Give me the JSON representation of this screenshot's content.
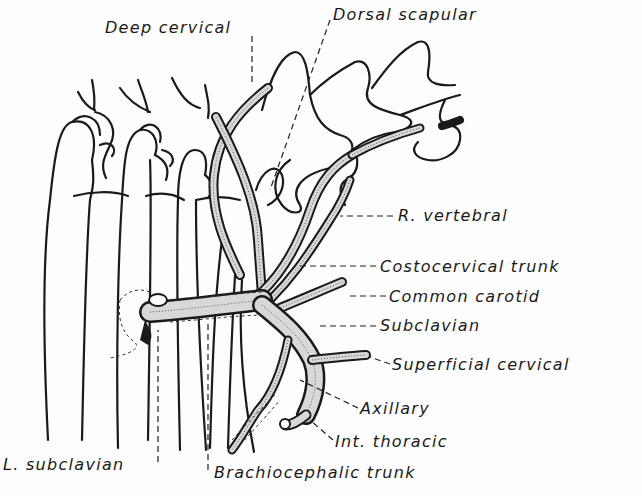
{
  "figure": {
    "labels": [
      {
        "id": "deep-cervical",
        "text": "Deep cervical",
        "x": 105,
        "y": 20
      },
      {
        "id": "dorsal-scapular",
        "text": "Dorsal scapular",
        "x": 333,
        "y": 7
      },
      {
        "id": "r-vertebral",
        "text": "R. vertebral",
        "x": 398,
        "y": 208
      },
      {
        "id": "costocervical-trunk",
        "text": "Costocervical trunk",
        "x": 380,
        "y": 259
      },
      {
        "id": "common-carotid",
        "text": "Common carotid",
        "x": 389,
        "y": 289
      },
      {
        "id": "subclavian",
        "text": "Subclavian",
        "x": 380,
        "y": 318
      },
      {
        "id": "superficial-cervical",
        "text": "Superficial cervical",
        "x": 392,
        "y": 357
      },
      {
        "id": "axillary",
        "text": "Axillary",
        "x": 360,
        "y": 401
      },
      {
        "id": "int-thoracic",
        "text": "Int. thoracic",
        "x": 335,
        "y": 434
      },
      {
        "id": "l-subclavian",
        "text": "L. subclavian",
        "x": 3,
        "y": 457
      },
      {
        "id": "brachiocephalic-trunk",
        "text": "Brachiocephalic trunk",
        "x": 214,
        "y": 465
      }
    ]
  }
}
